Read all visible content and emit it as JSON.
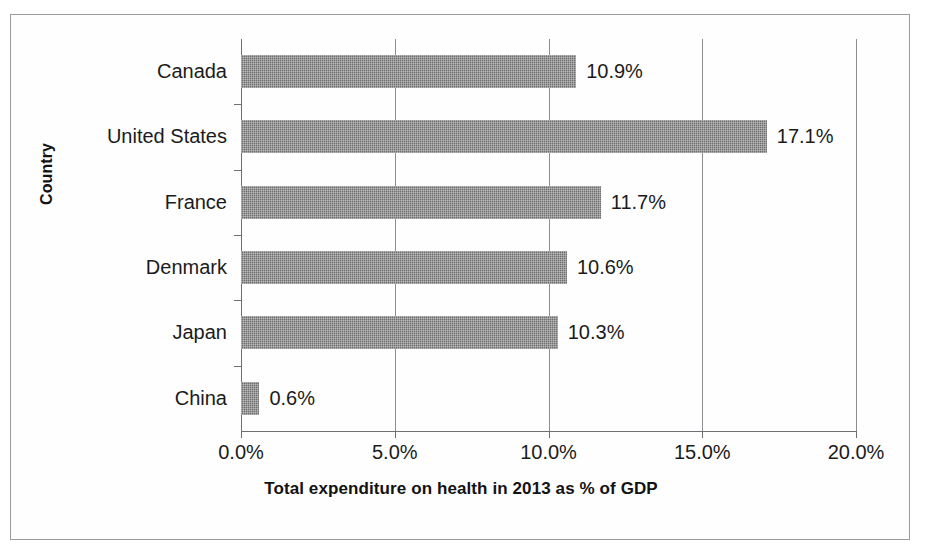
{
  "page": {
    "clipped_header_text": "……………………………………………"
  },
  "chart_data": {
    "type": "bar",
    "orientation": "horizontal",
    "title": "",
    "xlabel": "Total expenditure on health in 2013 as % of GDP",
    "ylabel": "Country",
    "categories": [
      "Canada",
      "United States",
      "France",
      "Denmark",
      "Japan",
      "China"
    ],
    "values": [
      10.9,
      17.1,
      11.7,
      10.6,
      10.3,
      0.6
    ],
    "data_labels": [
      "10.9%",
      "17.1%",
      "11.7%",
      "10.6%",
      "10.3%",
      "0.6%"
    ],
    "xlim": [
      0,
      20
    ],
    "xticks": [
      0,
      5,
      10,
      15,
      20
    ],
    "xtick_labels": [
      "0.0%",
      "5.0%",
      "10.0%",
      "15.0%",
      "20.0%"
    ],
    "grid": true,
    "legend": false,
    "series_color": "#6f6f6f",
    "axis_color": "#6e6e73",
    "text_color": "#1b1b1b"
  }
}
